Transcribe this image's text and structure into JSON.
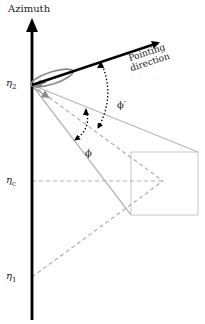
{
  "diagram": {
    "axis_title": "Azimuth",
    "labels": {
      "eta_2": {
        "base": "η",
        "sub": "2"
      },
      "eta_c": {
        "base": "η",
        "sub": "c"
      },
      "eta_1": {
        "base": "η",
        "sub": "1"
      },
      "phi_prime": "ϕ′",
      "phi": "ϕ",
      "pointing_line1": "Pointing",
      "pointing_line2": "direction"
    },
    "colors": {
      "axis": "#000000",
      "pointing_arrow": "#000000",
      "beam_lines": "#b8b8b8",
      "dashed_lines": "#b0b0b0",
      "target_box": "#c8c8c8",
      "beam_lobe": "#8a8a8a"
    }
  }
}
